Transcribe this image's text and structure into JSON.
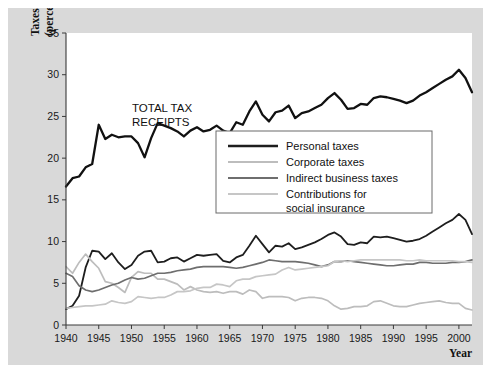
{
  "figure": {
    "background_color": "#d9d9d9",
    "plot_background_color": "#ffffff",
    "axis_color": "#3a3a3a"
  },
  "annotations": {
    "total_label_line1": "TOTAL TAX",
    "total_label_line2": "RECEIPTS"
  },
  "axis": {
    "y_title_line1": "Taxes",
    "y_title_line2": "(percent of GDP)",
    "x_title": "Year"
  },
  "chart_data": {
    "type": "line",
    "title": "",
    "xlabel": "Year",
    "ylabel": "Taxes (percent of GDP)",
    "xlim": [
      1940,
      2002
    ],
    "ylim": [
      0,
      35
    ],
    "xticks": [
      1940,
      1945,
      1950,
      1955,
      1960,
      1965,
      1970,
      1975,
      1980,
      1985,
      1990,
      1995,
      2000
    ],
    "yticks": [
      0,
      5,
      10,
      15,
      20,
      25,
      30,
      35
    ],
    "grid": false,
    "legend_position": "center",
    "x": [
      1940,
      1941,
      1942,
      1943,
      1944,
      1945,
      1946,
      1947,
      1948,
      1949,
      1950,
      1951,
      1952,
      1953,
      1954,
      1955,
      1956,
      1957,
      1958,
      1959,
      1960,
      1961,
      1962,
      1963,
      1964,
      1965,
      1966,
      1967,
      1968,
      1969,
      1970,
      1971,
      1972,
      1973,
      1974,
      1975,
      1976,
      1977,
      1978,
      1979,
      1980,
      1981,
      1982,
      1983,
      1984,
      1985,
      1986,
      1987,
      1988,
      1989,
      1990,
      1991,
      1992,
      1993,
      1994,
      1995,
      1996,
      1997,
      1998,
      1999,
      2000,
      2001,
      2002
    ],
    "series": [
      {
        "name": "Total tax receipts",
        "color": "#111111",
        "width": 2.3,
        "in_legend": false,
        "values": [
          16.6,
          17.6,
          17.8,
          18.9,
          19.3,
          24.0,
          22.3,
          22.8,
          22.5,
          22.6,
          22.6,
          21.8,
          20.1,
          22.4,
          24.2,
          23.9,
          23.6,
          23.2,
          22.6,
          23.3,
          23.7,
          23.2,
          23.4,
          23.9,
          23.3,
          23.0,
          24.3,
          24.0,
          25.6,
          26.8,
          25.2,
          24.4,
          25.5,
          25.7,
          26.3,
          24.8,
          25.4,
          25.6,
          26.0,
          26.4,
          27.2,
          27.8,
          27.0,
          25.9,
          26.0,
          26.5,
          26.4,
          27.2,
          27.4,
          27.3,
          27.1,
          26.9,
          26.6,
          26.9,
          27.5,
          27.9,
          28.4,
          28.9,
          29.4,
          29.8,
          30.6,
          29.6,
          27.9
        ]
      },
      {
        "name": "Personal taxes",
        "color": "#1e1e1e",
        "width": 1.8,
        "in_legend": true,
        "values": [
          1.9,
          2.3,
          3.5,
          6.9,
          8.9,
          8.8,
          7.9,
          8.6,
          7.5,
          6.7,
          7.2,
          8.3,
          8.8,
          8.9,
          7.5,
          7.6,
          8.0,
          8.1,
          7.6,
          8.0,
          8.4,
          8.3,
          8.4,
          8.5,
          7.7,
          7.5,
          8.1,
          8.4,
          9.5,
          10.7,
          9.7,
          8.7,
          9.5,
          9.4,
          9.8,
          9.1,
          9.3,
          9.6,
          9.9,
          10.3,
          10.8,
          11.1,
          10.6,
          9.7,
          9.6,
          9.9,
          9.8,
          10.6,
          10.5,
          10.6,
          10.4,
          10.2,
          10.0,
          10.1,
          10.3,
          10.7,
          11.2,
          11.7,
          12.2,
          12.6,
          13.3,
          12.6,
          10.9
        ]
      },
      {
        "name": "Corporate taxes",
        "color": "#bdbdbd",
        "width": 1.7,
        "in_legend": true,
        "values": [
          7.0,
          6.2,
          7.5,
          8.5,
          7.6,
          6.8,
          5.2,
          5.0,
          4.5,
          3.9,
          5.7,
          6.4,
          6.2,
          6.2,
          5.5,
          5.5,
          5.2,
          4.9,
          4.2,
          4.6,
          4.2,
          4.0,
          3.9,
          4.0,
          3.8,
          4.0,
          4.0,
          3.7,
          4.2,
          4.0,
          3.2,
          3.4,
          3.4,
          3.4,
          3.3,
          2.9,
          3.2,
          3.3,
          3.3,
          3.2,
          2.9,
          2.3,
          1.9,
          2.0,
          2.2,
          2.2,
          2.3,
          2.8,
          2.9,
          2.6,
          2.3,
          2.2,
          2.2,
          2.4,
          2.6,
          2.7,
          2.8,
          2.9,
          2.7,
          2.6,
          2.6,
          2.0,
          1.8
        ]
      },
      {
        "name": "Indirect business taxes",
        "color": "#6e6e6e",
        "width": 1.7,
        "in_legend": true,
        "values": [
          6.2,
          5.8,
          4.7,
          4.2,
          4.0,
          4.2,
          4.5,
          4.8,
          5.0,
          5.4,
          5.7,
          5.5,
          5.6,
          5.9,
          6.2,
          6.2,
          6.3,
          6.5,
          6.6,
          6.7,
          6.9,
          7.0,
          7.0,
          7.0,
          7.0,
          6.9,
          6.8,
          6.9,
          7.1,
          7.3,
          7.5,
          7.8,
          7.7,
          7.6,
          7.6,
          7.6,
          7.5,
          7.4,
          7.2,
          7.0,
          7.2,
          7.6,
          7.6,
          7.7,
          7.6,
          7.5,
          7.4,
          7.3,
          7.2,
          7.1,
          7.1,
          7.2,
          7.3,
          7.3,
          7.5,
          7.5,
          7.4,
          7.4,
          7.4,
          7.5,
          7.5,
          7.6,
          7.8
        ]
      },
      {
        "name": "Contributions for social insurance",
        "color": "#c6c6c6",
        "width": 1.7,
        "in_legend": true,
        "values": [
          2.0,
          2.1,
          2.2,
          2.3,
          2.3,
          2.4,
          2.5,
          2.9,
          2.7,
          2.6,
          2.8,
          3.4,
          3.3,
          3.2,
          3.3,
          3.3,
          3.6,
          4.0,
          4.0,
          4.1,
          4.4,
          4.5,
          4.5,
          4.9,
          4.8,
          4.6,
          5.3,
          5.5,
          5.5,
          5.8,
          5.9,
          6.0,
          6.1,
          6.6,
          6.9,
          6.6,
          6.7,
          6.8,
          6.9,
          7.0,
          7.1,
          7.6,
          7.7,
          7.6,
          7.7,
          7.8,
          7.8,
          7.8,
          7.8,
          7.8,
          7.8,
          7.8,
          7.7,
          7.7,
          7.8,
          7.7,
          7.7,
          7.7,
          7.7,
          7.7,
          7.6,
          7.6,
          7.5
        ]
      }
    ],
    "legend_entries": [
      {
        "label": "Personal taxes",
        "color": "#1e1e1e",
        "width": 2.6
      },
      {
        "label": "Corporate taxes",
        "color": "#bdbdbd",
        "width": 1.8
      },
      {
        "label": "Indirect business taxes",
        "color": "#6e6e6e",
        "width": 2.0
      },
      {
        "label": "Contributions for",
        "label2": "social insurance",
        "color": "#c6c6c6",
        "width": 1.8
      }
    ]
  }
}
